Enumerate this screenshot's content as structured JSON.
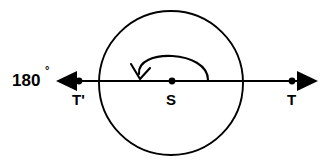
{
  "figure": {
    "colors": {
      "ink": "#000000",
      "background": "#ffffff"
    },
    "labels": {
      "angle": "180",
      "degree_symbol": "°",
      "point_t_prime": "T'",
      "point_s": "S",
      "point_t": "T"
    },
    "icons": {
      "left_arrow": "arrow-left-icon",
      "right_arrow": "arrow-right-icon",
      "rotation_arc": "rotation-arrow-icon",
      "circle": "circle-icon"
    },
    "geometry": {
      "circle": {
        "cx": 171,
        "cy": 83,
        "r": 72
      },
      "axis_line": {
        "x1": 60,
        "y1": 81,
        "x2": 314,
        "y2": 81
      },
      "points": [
        {
          "name": "T'",
          "x": 79,
          "y": 81
        },
        {
          "name": "S",
          "x": 172,
          "y": 81
        },
        {
          "name": "T",
          "x": 292,
          "y": 81
        }
      ],
      "arrowheads": [
        {
          "name": "left",
          "tip_x": 56,
          "tip_y": 81,
          "base_x": 76
        },
        {
          "name": "right",
          "tip_x": 318,
          "tip_y": 81,
          "base_x": 298
        }
      ],
      "rotation_arc": {
        "start_x": 208,
        "start_y": 80,
        "end_x": 140,
        "end_y": 76,
        "apex_y": 57
      }
    }
  }
}
